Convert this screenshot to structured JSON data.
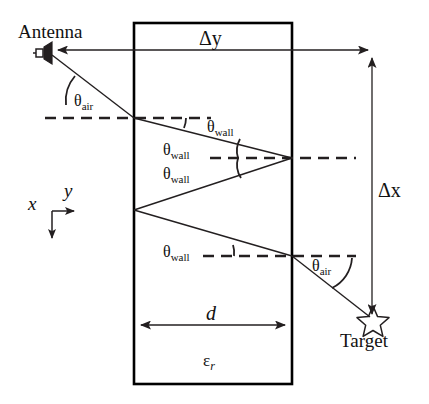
{
  "figure": {
    "type": "through-wall-propagation-ray-diagram",
    "background_color": "#ffffff",
    "line_color": "#231f20",
    "wall_border_color": "#000000"
  },
  "labels": {
    "antenna": "Antenna",
    "target": "Target",
    "delta_y": "Δy",
    "delta_x": "Δx",
    "thickness": "d",
    "permittivity_base": "ε",
    "permittivity_sub": "r",
    "theta_symbol": "θ",
    "theta_air_sub": "air",
    "theta_wall_sub": "wall",
    "axis_x": "x",
    "axis_y": "y"
  },
  "angle_labels": [
    {
      "id": "theta-air-top",
      "base": "θ",
      "sub": "air",
      "x": 74,
      "y": 93
    },
    {
      "id": "theta-wall-1",
      "base": "θ",
      "sub": "wall",
      "x": 207,
      "y": 119
    },
    {
      "id": "theta-wall-2",
      "base": "θ",
      "sub": "wall",
      "x": 163,
      "y": 142
    },
    {
      "id": "theta-wall-3",
      "base": "θ",
      "sub": "wall",
      "x": 163,
      "y": 166
    },
    {
      "id": "theta-wall-4",
      "base": "θ",
      "sub": "wall",
      "x": 163,
      "y": 244
    },
    {
      "id": "theta-air-bottom",
      "base": "θ",
      "sub": "air",
      "x": 312,
      "y": 260
    }
  ],
  "geometry": {
    "wall": {
      "x_left": 134,
      "x_right": 292,
      "y_top": 23,
      "y_bottom": 384
    },
    "antenna_point": {
      "x": 52,
      "y": 53
    },
    "target_point": {
      "x": 373,
      "y": 320
    },
    "ray_vertices": [
      {
        "x": 52,
        "y": 53
      },
      {
        "x": 134,
        "y": 118
      },
      {
        "x": 292,
        "y": 158
      },
      {
        "x": 134,
        "y": 210
      },
      {
        "x": 292,
        "y": 256
      },
      {
        "x": 373,
        "y": 320
      }
    ],
    "dashed_normals": [
      {
        "x1": 45,
        "y1": 118,
        "x2": 211,
        "y2": 118
      },
      {
        "x1": 210,
        "y1": 158,
        "x2": 356,
        "y2": 158
      },
      {
        "x1": 203,
        "y1": 256,
        "x2": 356,
        "y2": 256
      }
    ],
    "delta_y_arrow": {
      "x1": 52,
      "y1": 50,
      "x2": 373,
      "y2": 50
    },
    "delta_x_arrow": {
      "x": 372,
      "y1": 320,
      "y2": 52
    },
    "thickness_arrow": {
      "y": 325,
      "x1": 135,
      "x2": 291
    },
    "axis_origin": {
      "x": 52,
      "y": 211
    }
  },
  "measure_labels": {
    "delta_y": {
      "x": 199,
      "y": 30
    },
    "delta_x": {
      "x": 378,
      "y": 182
    },
    "d": {
      "x": 206,
      "y": 305
    },
    "epsilon_r": {
      "x": 203,
      "y": 353
    },
    "antenna": {
      "x": 18,
      "y": 22
    },
    "target": {
      "x": 340,
      "y": 331
    },
    "axis_y": {
      "x": 64,
      "y": 183
    },
    "axis_x": {
      "x": 28,
      "y": 196
    }
  }
}
